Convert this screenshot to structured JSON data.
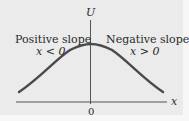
{
  "diagram": {
    "y_axis_label": "U",
    "x_axis_label": "x",
    "origin_tick": "0",
    "left_region": {
      "title": "Positive slope",
      "condition": "x < 0"
    },
    "right_region": {
      "title": "Negative slope",
      "condition": "x > 0"
    },
    "curve": {
      "shape": "bell-shaped potential energy curve with maximum at x = 0",
      "color": "#4a4a4a"
    },
    "colors": {
      "background": "#ebebeb",
      "axis": "#555555",
      "curve": "#4a4a4a",
      "text": "#2a2a2a"
    }
  }
}
